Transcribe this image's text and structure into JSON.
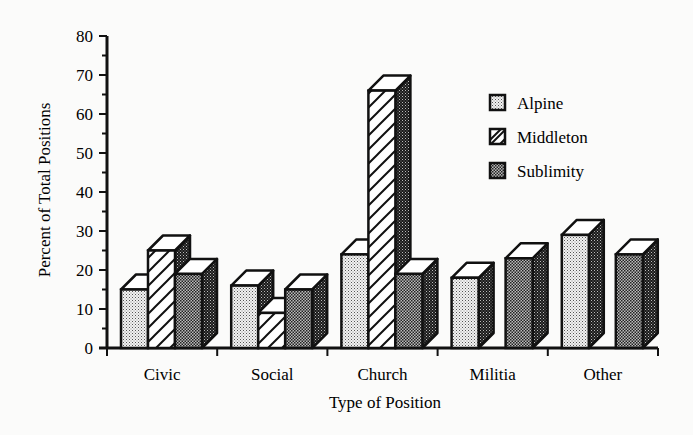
{
  "chart_data": {
    "type": "bar",
    "style": "3d-clustered",
    "title": "",
    "xlabel": "Type of Position",
    "ylabel": "Percent of Total Positions",
    "ylim": [
      0,
      80
    ],
    "yticks": [
      0,
      10,
      20,
      30,
      40,
      50,
      60,
      70,
      80
    ],
    "categories": [
      "Civic",
      "Social",
      "Church",
      "Militia",
      "Other"
    ],
    "series": [
      {
        "name": "Alpine",
        "pattern": "light-dots",
        "values": [
          15,
          16,
          24,
          18,
          29
        ]
      },
      {
        "name": "Middleton",
        "pattern": "diagonal-hatch",
        "values": [
          25,
          9,
          66,
          0,
          0
        ]
      },
      {
        "name": "Sublimity",
        "pattern": "dark-dots",
        "values": [
          19,
          15,
          19,
          23,
          24
        ]
      }
    ],
    "legend_position": "upper-right",
    "grid": false
  }
}
